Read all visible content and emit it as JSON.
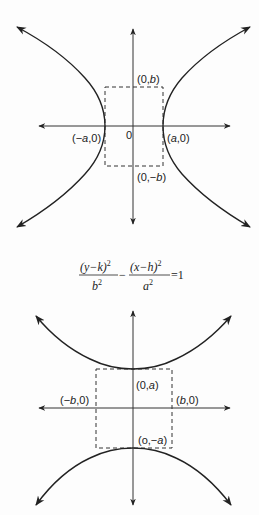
{
  "top_diagram": {
    "title": "Horizontal hyperbola",
    "labels": {
      "origin": "0",
      "vertex_left_pre": "(−",
      "vertex_left_var": "a",
      "vertex_left_post": ",0)",
      "vertex_right_pre": "(",
      "vertex_right_var": "a",
      "vertex_right_post": ",0)",
      "co_vertex_top_pre": "(0,",
      "co_vertex_top_var": "b",
      "co_vertex_top_post": ")",
      "co_vertex_bottom_pre": "(0,−",
      "co_vertex_bottom_var": "b",
      "co_vertex_bottom_post": ")"
    }
  },
  "formula": {
    "num1": "(y−k)",
    "num1_exp": "2",
    "den1": "b",
    "den1_exp": "2",
    "minus": "−",
    "num2": "(x−h)",
    "num2_exp": "2",
    "den2": "a",
    "den2_exp": "2",
    "equals": "=1"
  },
  "bottom_diagram": {
    "title": "Vertical hyperbola",
    "labels": {
      "vertex_top_pre": "(0,",
      "vertex_top_var": "a",
      "vertex_top_post": ")",
      "vertex_bottom_pre": "(o,−",
      "vertex_bottom_var": "a",
      "vertex_bottom_post": ")",
      "co_vertex_left_pre": "(−",
      "co_vertex_left_var": "b",
      "co_vertex_left_post": ",0)",
      "co_vertex_right_pre": "(",
      "co_vertex_right_var": "b",
      "co_vertex_right_post": ",0)"
    }
  }
}
